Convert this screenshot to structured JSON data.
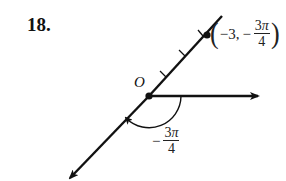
{
  "problem": {
    "number": "18."
  },
  "diagram": {
    "origin_label": "O",
    "point": {
      "open": "(",
      "r": "−3,",
      "theta_sign": "−",
      "theta_num": "3",
      "theta_pi": "π",
      "theta_den": "4",
      "close": ")"
    },
    "angle": {
      "sign": "−",
      "num": "3",
      "pi": "π",
      "den": "4"
    },
    "ticks_on_ray": 3,
    "colors": {
      "ink": "#111111",
      "background": "#ffffff"
    }
  }
}
